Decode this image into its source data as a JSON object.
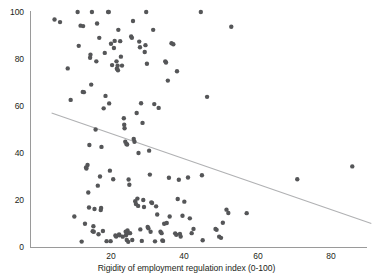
{
  "chart_data": {
    "type": "scatter",
    "title": "",
    "subtitle": "",
    "xlabel": "Rigidity of employment regulation index (0-100)",
    "ylabel": "",
    "xlim": [
      0,
      90
    ],
    "ylim": [
      0,
      100
    ],
    "xticks": [
      20,
      40,
      60,
      80
    ],
    "xtick_labels": [
      "20",
      "40",
      "60",
      "80"
    ],
    "yticks": [
      0,
      20,
      40,
      60,
      80,
      100
    ],
    "ytick_labels": [
      "0",
      "20",
      "40",
      "60",
      "80",
      "100"
    ],
    "grid": false,
    "legend": null,
    "point_color": "#555658",
    "line_color": "#b0b1b3",
    "axis_color": "#9a9a9a",
    "marker_radius_px": 2.2,
    "series": [
      {
        "name": "countries",
        "type": "scatter",
        "points": [
          [
            4.6,
            96.8
          ],
          [
            6.1,
            95.7
          ],
          [
            8.2,
            76.0
          ],
          [
            9.0,
            62.6
          ],
          [
            10.0,
            13.0
          ],
          [
            10.9,
            100.0
          ],
          [
            11.2,
            85.6
          ],
          [
            11.7,
            94.2
          ],
          [
            12.0,
            2.3
          ],
          [
            12.4,
            94.0
          ],
          [
            12.3,
            66.0
          ],
          [
            12.6,
            65.9
          ],
          [
            12.9,
            9.9
          ],
          [
            13.2,
            33.8
          ],
          [
            13.3,
            33.4
          ],
          [
            13.6,
            34.9
          ],
          [
            13.8,
            23.2
          ],
          [
            14.0,
            16.8
          ],
          [
            14.1,
            43.4
          ],
          [
            14.3,
            80.5
          ],
          [
            14.4,
            81.8
          ],
          [
            14.6,
            69.1
          ],
          [
            14.8,
            100.0
          ],
          [
            15.0,
            6.7
          ],
          [
            15.2,
            8.8
          ],
          [
            15.3,
            6.5
          ],
          [
            15.5,
            16.2
          ],
          [
            15.8,
            50.0
          ],
          [
            16.0,
            79.0
          ],
          [
            16.2,
            95.1
          ],
          [
            16.4,
            26.1
          ],
          [
            16.6,
            5.4
          ],
          [
            16.8,
            89.0
          ],
          [
            17.0,
            30.0
          ],
          [
            17.2,
            15.7
          ],
          [
            17.3,
            16.6
          ],
          [
            17.4,
            42.6
          ],
          [
            17.8,
            6.8
          ],
          [
            18.0,
            59.0
          ],
          [
            18.3,
            82.6
          ],
          [
            18.5,
            64.3
          ],
          [
            18.8,
            2.5
          ],
          [
            19.2,
            100.0
          ],
          [
            19.4,
            100.0
          ],
          [
            19.5,
            61.1
          ],
          [
            19.7,
            32.5
          ],
          [
            19.9,
            2.5
          ],
          [
            20.0,
            86.5
          ],
          [
            20.3,
            77.4
          ],
          [
            20.6,
            28.8
          ],
          [
            20.8,
            84.7
          ],
          [
            21.0,
            87.7
          ],
          [
            21.2,
            4.9
          ],
          [
            21.4,
            4.5
          ],
          [
            21.5,
            79.0
          ],
          [
            21.6,
            75.9
          ],
          [
            21.8,
            77.1
          ],
          [
            21.9,
            75.2
          ],
          [
            22.0,
            92.4
          ],
          [
            22.2,
            5.3
          ],
          [
            22.3,
            5.0
          ],
          [
            22.5,
            87.6
          ],
          [
            22.7,
            81.0
          ],
          [
            23.0,
            77.2
          ],
          [
            23.2,
            4.4
          ],
          [
            23.5,
            54.8
          ],
          [
            23.6,
            52.0
          ],
          [
            23.7,
            50.5
          ],
          [
            23.9,
            44.8
          ],
          [
            24.0,
            6.5
          ],
          [
            24.1,
            5.0
          ],
          [
            24.2,
            43.8
          ],
          [
            24.3,
            3.0
          ],
          [
            24.4,
            43.6
          ],
          [
            24.5,
            7.0
          ],
          [
            24.6,
            6.0
          ],
          [
            24.7,
            2.2
          ],
          [
            24.8,
            28.7
          ],
          [
            25.0,
            26.5
          ],
          [
            25.2,
            5.9
          ],
          [
            25.5,
            89.6
          ],
          [
            25.7,
            89.0
          ],
          [
            25.8,
            3.0
          ],
          [
            26.0,
            96.2
          ],
          [
            26.2,
            46.0
          ],
          [
            26.4,
            44.8
          ],
          [
            26.6,
            19.5
          ],
          [
            26.8,
            18.3
          ],
          [
            27.0,
            57.0
          ],
          [
            27.2,
            20.6
          ],
          [
            27.4,
            17.5
          ],
          [
            27.5,
            40.0
          ],
          [
            27.7,
            87.4
          ],
          [
            27.9,
            85.0
          ],
          [
            28.0,
            7.5
          ],
          [
            28.2,
            61.2
          ],
          [
            28.4,
            2.6
          ],
          [
            28.6,
            52.8
          ],
          [
            28.8,
            20.0
          ],
          [
            29.0,
            17.0
          ],
          [
            29.2,
            83.0
          ],
          [
            29.4,
            85.9
          ],
          [
            29.6,
            100.0
          ],
          [
            29.8,
            78.0
          ],
          [
            30.0,
            8.5
          ],
          [
            30.2,
            8.0
          ],
          [
            30.4,
            41.0
          ],
          [
            30.6,
            30.8
          ],
          [
            30.8,
            6.5
          ],
          [
            31.0,
            19.0
          ],
          [
            31.2,
            18.7
          ],
          [
            31.5,
            92.4
          ],
          [
            31.8,
            60.8
          ],
          [
            32.0,
            2.4
          ],
          [
            32.3,
            17.3
          ],
          [
            32.6,
            13.8
          ],
          [
            33.0,
            59.2
          ],
          [
            33.5,
            6.5
          ],
          [
            33.8,
            5.9
          ],
          [
            34.0,
            2.8
          ],
          [
            34.2,
            2.6
          ],
          [
            34.5,
            9.9
          ],
          [
            34.8,
            79.0
          ],
          [
            35.0,
            78.5
          ],
          [
            35.2,
            10.2
          ],
          [
            35.5,
            70.8
          ],
          [
            35.8,
            29.5
          ],
          [
            36.0,
            13.0
          ],
          [
            36.5,
            86.7
          ],
          [
            37.0,
            86.3
          ],
          [
            37.5,
            5.8
          ],
          [
            37.8,
            5.2
          ],
          [
            38.0,
            74.8
          ],
          [
            38.2,
            20.4
          ],
          [
            38.5,
            28.6
          ],
          [
            38.8,
            5.5
          ],
          [
            39.0,
            4.5
          ],
          [
            39.5,
            13.3
          ],
          [
            40.0,
            19.3
          ],
          [
            41.0,
            29.6
          ],
          [
            41.5,
            12.2
          ],
          [
            42.0,
            5.9
          ],
          [
            42.5,
            7.7
          ],
          [
            44.5,
            100.0
          ],
          [
            44.8,
            30.5
          ],
          [
            45.0,
            2.9
          ],
          [
            46.2,
            63.9
          ],
          [
            48.5,
            7.7
          ],
          [
            48.8,
            7.3
          ],
          [
            49.5,
            4.4
          ],
          [
            50.0,
            3.9
          ],
          [
            50.5,
            10.3
          ],
          [
            51.5,
            15.9
          ],
          [
            52.0,
            14.5
          ],
          [
            52.8,
            93.7
          ],
          [
            57.0,
            14.4
          ],
          [
            70.8,
            28.8
          ],
          [
            85.8,
            34.3
          ]
        ]
      }
    ],
    "trend_line": {
      "name": "linear fit",
      "x0": 3.8,
      "y0": 57.0,
      "x1": 91.0,
      "y1": 10.0
    }
  }
}
